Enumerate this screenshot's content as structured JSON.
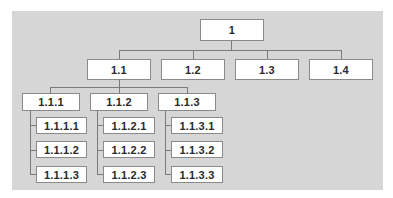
{
  "diagram": {
    "type": "hierarchy-tree",
    "colors": {
      "background": "#d6d6d6",
      "box": "#ffffff",
      "border": "#8a8a8a",
      "line": "#7a7a7a"
    },
    "root": {
      "label": "1"
    },
    "level1": [
      {
        "label": "1.1"
      },
      {
        "label": "1.2"
      },
      {
        "label": "1.3"
      },
      {
        "label": "1.4"
      }
    ],
    "level2": [
      {
        "label": "1.1.1",
        "children": [
          {
            "label": "1.1.1.1"
          },
          {
            "label": "1.1.1.2"
          },
          {
            "label": "1.1.1.3"
          }
        ]
      },
      {
        "label": "1.1.2",
        "children": [
          {
            "label": "1.1.2.1"
          },
          {
            "label": "1.1.2.2"
          },
          {
            "label": "1.1.2.3"
          }
        ]
      },
      {
        "label": "1.1.3",
        "children": [
          {
            "label": "1.1.3.1"
          },
          {
            "label": "1.1.3.2"
          },
          {
            "label": "1.1.3.3"
          }
        ]
      }
    ]
  }
}
